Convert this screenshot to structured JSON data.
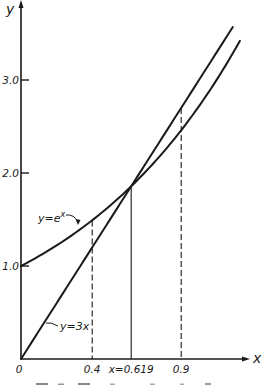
{
  "chart_data": {
    "type": "line",
    "title": "",
    "xlabel": "x",
    "ylabel": "y",
    "xlim": [
      0,
      1.25
    ],
    "ylim": [
      0,
      3.7
    ],
    "grid": false,
    "y_ticks": [
      {
        "value": 1.0,
        "label": "1.0"
      },
      {
        "value": 2.0,
        "label": "2.0"
      },
      {
        "value": 3.0,
        "label": "3.0"
      }
    ],
    "x_ticks": [
      {
        "value": 0,
        "label": "0"
      },
      {
        "value": 0.4,
        "label": "0.4"
      },
      {
        "value": 0.619,
        "label": "x=0.619"
      },
      {
        "value": 0.9,
        "label": "0.9"
      }
    ],
    "series": [
      {
        "name": "y=e^x",
        "label": "y=e",
        "superscript": "x",
        "function": "exp",
        "x_range": [
          0,
          1.23
        ]
      },
      {
        "name": "y=3x",
        "label": "y=3x",
        "function": "linear",
        "slope": 3,
        "x_range": [
          0,
          1.19
        ]
      }
    ],
    "intersection": {
      "x": 0.619,
      "y": 1.857
    },
    "vertical_guides": [
      {
        "x": 0.4,
        "style": "dashed",
        "to": "exp",
        "y_top": 1.49
      },
      {
        "x": 0.619,
        "style": "solid",
        "to": "intersection",
        "y_top": 1.857
      },
      {
        "x": 0.9,
        "style": "dashed",
        "to": "linear",
        "y_top": 2.7
      }
    ],
    "caption_visible": "partially clipped (illegible)"
  },
  "layout": {
    "origin_px": [
      21,
      359
    ],
    "px_per_x": 178,
    "px_per_y": 93
  }
}
